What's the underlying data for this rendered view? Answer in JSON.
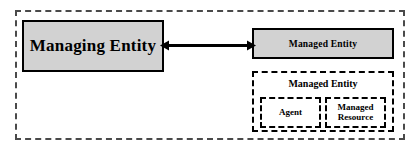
{
  "diagram": {
    "type": "block-diagram",
    "background_color": "#ffffff",
    "outer_frame": {
      "name": "management-system-boundary",
      "border_style": "dashed",
      "border_color": "#4a4a4a",
      "fill": "transparent"
    },
    "nodes": [
      {
        "id": "managing-entity",
        "label": "Managing Entity",
        "shape": "rectangle",
        "fill_color": "#d2d2d2",
        "border_style": "solid",
        "border_color": "#000000"
      },
      {
        "id": "managed-entity",
        "label": "Managed Entity",
        "shape": "rectangle",
        "fill_color": "#d2d2d2",
        "border_style": "solid",
        "border_color": "#000000"
      }
    ],
    "detail_group": {
      "id": "managed-entity-detail",
      "title": "Managed Entity",
      "border_style": "dashed",
      "border_color": "#000000",
      "fill_color": "#ffffff",
      "children": [
        {
          "id": "agent",
          "label": "Agent",
          "border_style": "dashed",
          "fill_color": "#ffffff"
        },
        {
          "id": "managed-resource",
          "label_line1": "Managed",
          "label_line2": "Resource",
          "border_style": "dashed",
          "fill_color": "#ffffff"
        }
      ]
    },
    "connector": {
      "id": "management-link",
      "style": "bidirectional-arrow",
      "color": "#000000",
      "label": ""
    }
  }
}
